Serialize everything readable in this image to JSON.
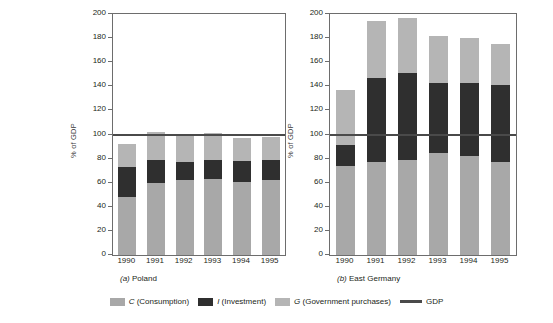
{
  "chart_data": [
    {
      "type": "bar",
      "title": "(a)  Poland",
      "panel_letter": "(a)",
      "panel_name": "Poland",
      "xlabel": "",
      "ylabel": "% of GDP",
      "ylim": [
        0,
        200
      ],
      "yticks": [
        0,
        20,
        40,
        60,
        80,
        100,
        120,
        140,
        160,
        180,
        200
      ],
      "categories": [
        "1990",
        "1991",
        "1992",
        "1993",
        "1994",
        "1995"
      ],
      "stacked": true,
      "series": [
        {
          "name": "C (Consumption)",
          "color": "#a8a8a8",
          "values": [
            48,
            60,
            62,
            63,
            61,
            62
          ]
        },
        {
          "name": "I (Investment)",
          "color": "#2f2f2f",
          "values": [
            25,
            19,
            15,
            16,
            17,
            17
          ]
        },
        {
          "name": "G (Government purchases)",
          "color": "#b5b5b5",
          "values": [
            19,
            23,
            22,
            22,
            19,
            19
          ]
        }
      ],
      "totals": [
        92,
        102,
        99,
        101,
        97,
        98
      ],
      "reference_line": {
        "label": "GDP",
        "value": 100,
        "color": "#4a4a4a"
      },
      "grid": false
    },
    {
      "type": "bar",
      "title": "(b)  East Germany",
      "panel_letter": "(b)",
      "panel_name": "East Germany",
      "xlabel": "",
      "ylabel": "% of GDP",
      "ylim": [
        0,
        200
      ],
      "yticks": [
        0,
        20,
        40,
        60,
        80,
        100,
        120,
        140,
        160,
        180,
        200
      ],
      "categories": [
        "1990",
        "1991",
        "1992",
        "1993",
        "1994",
        "1995"
      ],
      "stacked": true,
      "series": [
        {
          "name": "C (Consumption)",
          "color": "#a8a8a8",
          "values": [
            74,
            77,
            79,
            85,
            82,
            77
          ]
        },
        {
          "name": "I (Investment)",
          "color": "#2f2f2f",
          "values": [
            17,
            70,
            72,
            58,
            61,
            64
          ]
        },
        {
          "name": "G (Government purchases)",
          "color": "#b5b5b5",
          "values": [
            46,
            47,
            46,
            39,
            37,
            34
          ]
        }
      ],
      "totals": [
        137,
        194,
        197,
        182,
        180,
        175
      ],
      "reference_line": {
        "label": "GDP",
        "value": 100,
        "color": "#4a4a4a"
      },
      "grid": false
    }
  ],
  "legend": {
    "position": "bottom",
    "items": [
      {
        "marker": "swatch",
        "label": "C (Consumption)",
        "italic_prefix": "C",
        "rest": " (Consumption)",
        "color": "#a8a8a8"
      },
      {
        "marker": "swatch",
        "label": "I (Investment)",
        "italic_prefix": "I",
        "rest": " (Investment)",
        "color": "#2f2f2f"
      },
      {
        "marker": "swatch",
        "label": "G (Government purchases)",
        "italic_prefix": "G",
        "rest": " (Government purchases)",
        "color": "#b5b5b5"
      },
      {
        "marker": "line",
        "label": "GDP",
        "italic_prefix": "",
        "rest": "GDP",
        "color": "#4a4a4a"
      }
    ]
  }
}
